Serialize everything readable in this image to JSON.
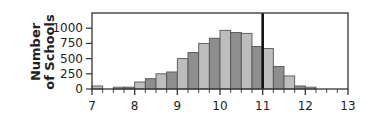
{
  "chart_data": {
    "type": "bar",
    "title": "",
    "xlabel": "",
    "ylabel": "Number of Schools",
    "ylabel_lines": [
      "Number",
      "of Schools"
    ],
    "xlim": [
      7,
      13
    ],
    "ylim": [
      0,
      1250
    ],
    "x_ticks": [
      7,
      8,
      9,
      10,
      11,
      12,
      13
    ],
    "y_ticks": [
      0,
      250,
      500,
      750,
      1000
    ],
    "bin_width": 0.25,
    "bins_start": [
      7.0,
      7.25,
      7.5,
      7.75,
      8.0,
      8.25,
      8.5,
      8.75,
      9.0,
      9.25,
      9.5,
      9.75,
      10.0,
      10.25,
      10.5,
      10.75,
      11.0,
      11.25,
      11.5,
      11.75,
      12.0
    ],
    "values": [
      50,
      0,
      30,
      30,
      115,
      170,
      250,
      280,
      500,
      600,
      750,
      835,
      965,
      930,
      915,
      700,
      665,
      370,
      215,
      50,
      30
    ],
    "reference_line": {
      "x": 11,
      "style": "thick black vertical line"
    },
    "grid": false,
    "legend": null,
    "colors": {
      "bar_light": "#bdbdbd",
      "bar_dark": "#8e8e8e",
      "bar_edge": "#555555",
      "axis": "#333333",
      "reference_line": "#111111"
    }
  }
}
